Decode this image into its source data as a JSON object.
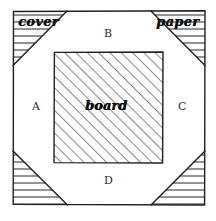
{
  "diagram": {
    "canvas": {
      "width": 216,
      "height": 221,
      "background": "#ffffff"
    },
    "line_color": "#1f1f1f",
    "hatch_color": "#3a3a3a",
    "outer_frame": {
      "left": 13,
      "top": 11,
      "right": 205,
      "bottom": 205
    },
    "inner_board": {
      "left": 54,
      "top": 52,
      "right": 163,
      "bottom": 163
    },
    "octagon_inset": 54,
    "labels": {
      "cover": "cover",
      "paper": "paper",
      "board": "board",
      "flap_a": "A",
      "flap_b": "B",
      "flap_c": "C",
      "flap_d": "D"
    },
    "regions": [
      {
        "name": "flap-a",
        "label": "A",
        "hatch": "none",
        "position": "left"
      },
      {
        "name": "flap-b",
        "label": "B",
        "hatch": "none",
        "position": "top"
      },
      {
        "name": "flap-c",
        "label": "C",
        "hatch": "none",
        "position": "right"
      },
      {
        "name": "flap-d",
        "label": "D",
        "hatch": "none",
        "position": "bottom"
      },
      {
        "name": "board-area",
        "label": "board",
        "hatch": "diagonal",
        "position": "center"
      },
      {
        "name": "corner-top-left",
        "label": "cover",
        "hatch": "horizontal",
        "position": "top-left"
      },
      {
        "name": "corner-top-right",
        "label": "paper",
        "hatch": "horizontal",
        "position": "top-right"
      },
      {
        "name": "corner-bottom-left",
        "label": "",
        "hatch": "horizontal",
        "position": "bottom-left"
      },
      {
        "name": "corner-bottom-right",
        "label": "",
        "hatch": "horizontal",
        "position": "bottom-right"
      }
    ]
  }
}
